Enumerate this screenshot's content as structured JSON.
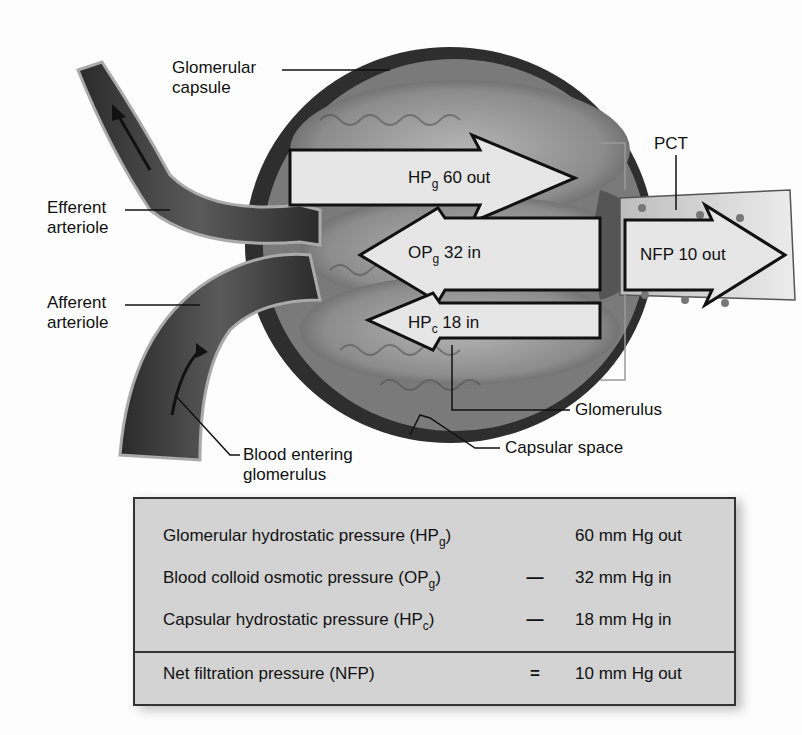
{
  "labels": {
    "glomerular_capsule": [
      "Glomerular",
      "capsule"
    ],
    "efferent_arteriole": [
      "Efferent",
      "arteriole"
    ],
    "afferent_arteriole": [
      "Afferent",
      "arteriole"
    ],
    "pct": "PCT",
    "glomerulus": "Glomerulus",
    "capsular_space": "Capsular space",
    "blood_entering": [
      "Blood entering",
      "glomerulus"
    ]
  },
  "arrows": [
    {
      "base": "HP",
      "sub": "g",
      "rest": " 60 out",
      "direction": "out"
    },
    {
      "base": "OP",
      "sub": "g",
      "rest": " 32 in",
      "direction": "in"
    },
    {
      "base": "HP",
      "sub": "c",
      "rest": " 18 in",
      "direction": "in"
    },
    {
      "base": "NFP 10 out",
      "sub": "",
      "rest": "",
      "direction": "out"
    }
  ],
  "table": {
    "rows": [
      {
        "name": "Glomerular hydrostatic pressure (HP",
        "sub": "g",
        "close": ")",
        "op": "",
        "value": "60 mm Hg out"
      },
      {
        "name": "Blood colloid osmotic pressure (OP",
        "sub": "g",
        "close": ")",
        "op": "—",
        "value": "32 mm Hg in"
      },
      {
        "name": "Capsular hydrostatic pressure (HP",
        "sub": "c",
        "close": ")",
        "op": "—",
        "value": "18 mm Hg in"
      },
      {
        "name": "Net filtration pressure (NFP)",
        "sub": "",
        "close": "",
        "op": "=",
        "value": "10 mm Hg out"
      }
    ]
  },
  "colors": {
    "table_bg": "#d3d3d3",
    "arrow_fill": "#e6e6e6",
    "tissue_dark": "#3a3a3a",
    "tissue_mid": "#8a8a8a",
    "tissue_light": "#bcbcbc"
  }
}
